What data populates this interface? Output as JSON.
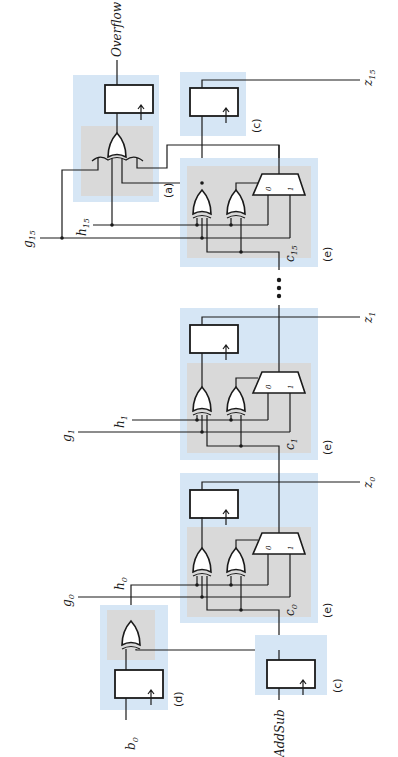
{
  "diagram": {
    "type": "circuit-schematic",
    "orientation": "rotated 90 degrees counter-clockwise",
    "title": "",
    "colors": {
      "block_outer": "#d6e6f5",
      "block_inner": "#d9d9d9",
      "wire": "#1a1a1a"
    },
    "blocks": {
      "a": "(a)",
      "c_top": "(c)",
      "e15": "(e)",
      "e1": "(e)",
      "e0": "(e)",
      "d": "(d)",
      "c_bottom": "(c)"
    },
    "signals": {
      "overflow": "Overflow",
      "addsub": "AddSub",
      "b0": {
        "base": "b",
        "sub": "0"
      },
      "g0": {
        "base": "g",
        "sub": "0"
      },
      "h0": {
        "base": "h",
        "sub": "0"
      },
      "c0": {
        "base": "c",
        "sub": "0"
      },
      "z0": {
        "base": "z",
        "sub": "0"
      },
      "g1": {
        "base": "g",
        "sub": "1"
      },
      "h1": {
        "base": "h",
        "sub": "1"
      },
      "c1": {
        "base": "c",
        "sub": "1"
      },
      "z1": {
        "base": "z",
        "sub": "1"
      },
      "g15": {
        "base": "g",
        "sub": "15"
      },
      "h15": {
        "base": "h",
        "sub": "15"
      },
      "c15": {
        "base": "c",
        "sub": "15"
      },
      "z15": {
        "base": "z",
        "sub": "15"
      }
    },
    "mux_inputs": {
      "zero": "0",
      "one": "1"
    },
    "ellipsis": "•••"
  }
}
